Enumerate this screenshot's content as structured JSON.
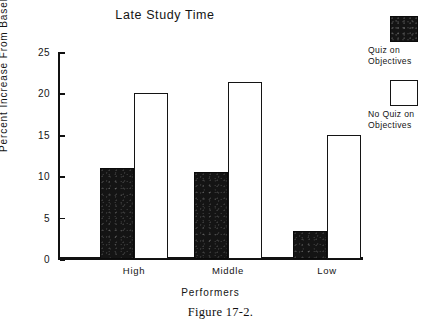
{
  "chart_data": {
    "type": "bar",
    "title": "Late Study Time",
    "xlabel": "Performers",
    "ylabel": "Percent Increase From Baseline",
    "categories": [
      "High",
      "Middle",
      "Low"
    ],
    "series": [
      {
        "name": "Quiz on Objectives",
        "values": [
          11.0,
          10.5,
          3.4
        ],
        "style": "filled"
      },
      {
        "name": "No Quiz on Objectives",
        "values": [
          20.0,
          21.4,
          15.0
        ],
        "style": "hollow"
      }
    ],
    "ylim": [
      0,
      25
    ],
    "yticks": [
      0,
      5,
      10,
      15,
      20,
      25
    ],
    "ytick_labels": [
      "0",
      "5",
      "10",
      "15",
      "20",
      "25"
    ],
    "grid": false,
    "legend_position": "right"
  },
  "caption": "Figure 17-2."
}
